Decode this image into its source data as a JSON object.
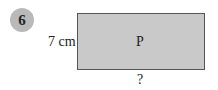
{
  "problem": {
    "number": "6"
  },
  "diagram": {
    "shape": "rectangle",
    "fill_color": "#c9c9c9",
    "border_color": "#555555",
    "side_label": "7 cm",
    "center_label": "P",
    "bottom_label": "?"
  }
}
